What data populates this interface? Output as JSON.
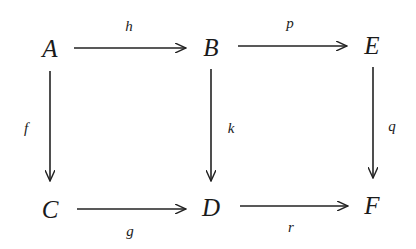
{
  "diagram": {
    "type": "commutative-diagram",
    "nodes": {
      "A": "A",
      "B": "B",
      "E": "E",
      "C": "C",
      "D": "D",
      "F": "F"
    },
    "arrows": [
      {
        "from": "A",
        "to": "B",
        "label": "h"
      },
      {
        "from": "B",
        "to": "E",
        "label": "p"
      },
      {
        "from": "A",
        "to": "C",
        "label": "f"
      },
      {
        "from": "B",
        "to": "D",
        "label": "k"
      },
      {
        "from": "E",
        "to": "F",
        "label": "q"
      },
      {
        "from": "C",
        "to": "D",
        "label": "g"
      },
      {
        "from": "D",
        "to": "F",
        "label": "r"
      }
    ]
  }
}
